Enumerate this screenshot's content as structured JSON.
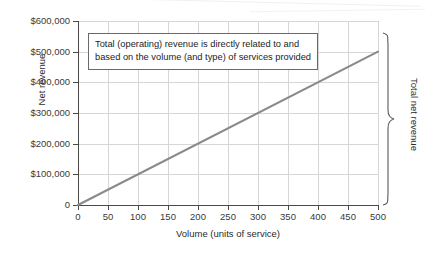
{
  "chart_data": {
    "type": "line",
    "title": "",
    "xlabel": "Volume (units of service)",
    "ylabel": "Net revenue",
    "xlim": [
      0,
      500
    ],
    "ylim": [
      0,
      600000
    ],
    "grid": true,
    "legend": "none",
    "x_ticks": [
      "0",
      "50",
      "100",
      "150",
      "200",
      "250",
      "300",
      "350",
      "400",
      "450",
      "500"
    ],
    "x_tick_values": [
      0,
      50,
      100,
      150,
      200,
      250,
      300,
      350,
      400,
      450,
      500
    ],
    "y_ticks": [
      "0",
      "$100,000",
      "$200,000",
      "$300,000",
      "$400,000",
      "$500,000",
      "$600,000"
    ],
    "y_tick_values": [
      0,
      100000,
      200000,
      300000,
      400000,
      500000,
      600000
    ],
    "series": [
      {
        "name": "Total net revenue",
        "color": "#8a8a8a",
        "x": [
          0,
          500
        ],
        "values": [
          0,
          500000
        ],
        "slope_per_unit": 1000
      }
    ],
    "annotations": [
      {
        "name": "callout-box",
        "lines": [
          "Total (operating) revenue is directly related to and",
          "based on the volume (and type) of services provided"
        ]
      },
      {
        "name": "right-brace",
        "label": "Total net revenue"
      }
    ]
  },
  "colors": {
    "line": "#8a8a8a",
    "axis": "#4a4a4a",
    "grid": "#d6d6d6",
    "text": "#2b2b2b",
    "box_border": "#6a6a6a",
    "background": "#ffffff"
  }
}
